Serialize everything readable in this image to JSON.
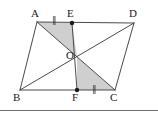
{
  "figure": {
    "width": 158,
    "height": 114,
    "background": "#ffffff",
    "stroke_color": "#4a4a4a",
    "shade_color": "#cfcfcf",
    "point_color": "#1a1a1a",
    "rule_color": "#6f6f6f",
    "rule_y": 110
  },
  "vertices": [
    {
      "name": "A",
      "label": "A",
      "x": 37,
      "y": 22,
      "label_x": 31,
      "label_y": 8,
      "dot": false
    },
    {
      "name": "E",
      "label": "E",
      "x": 72,
      "y": 23,
      "label_x": 67,
      "label_y": 8,
      "dot": true
    },
    {
      "name": "D",
      "label": "D",
      "x": 134,
      "y": 23,
      "label_x": 129,
      "label_y": 8,
      "dot": false
    },
    {
      "name": "O",
      "label": "O",
      "x": 77,
      "y": 57,
      "label_x": 66,
      "label_y": 50,
      "dot": false
    },
    {
      "name": "B",
      "label": "B",
      "x": 20,
      "y": 90,
      "label_x": 13,
      "label_y": 92,
      "dot": false
    },
    {
      "name": "F",
      "label": "F",
      "x": 77,
      "y": 90,
      "label_x": 72,
      "label_y": 92,
      "dot": true
    },
    {
      "name": "C",
      "label": "C",
      "x": 115,
      "y": 90,
      "label_x": 110,
      "label_y": 92,
      "dot": false
    }
  ],
  "edges": [
    {
      "name": "side-AD",
      "from": "A",
      "to": "D"
    },
    {
      "name": "side-AB",
      "from": "A",
      "to": "B"
    },
    {
      "name": "side-BC",
      "from": "B",
      "to": "C"
    },
    {
      "name": "side-DC",
      "from": "D",
      "to": "C"
    },
    {
      "name": "diagonal-AC",
      "from": "A",
      "to": "C"
    },
    {
      "name": "diagonal-BD",
      "from": "B",
      "to": "D"
    },
    {
      "name": "segment-EF",
      "from": "E",
      "to": "F"
    }
  ],
  "shaded_regions": [
    {
      "name": "triangle-AEO",
      "points": "A,E,O"
    },
    {
      "name": "triangle-OFC",
      "points": "O,F,C"
    }
  ],
  "tick_marks": [
    {
      "name": "tick-AE",
      "label": "∥",
      "x": 52,
      "y": 16,
      "segment": "AE"
    },
    {
      "name": "tick-FC",
      "label": "∥",
      "x": 92,
      "y": 85,
      "segment": "FC"
    }
  ]
}
